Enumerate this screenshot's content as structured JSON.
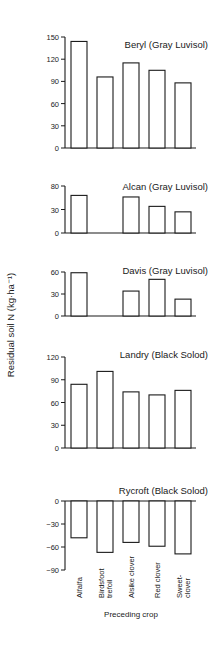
{
  "chart_data": {
    "type": "bar",
    "ylabel": "Residual soil N (kg·ha⁻¹)",
    "xlabel": "Preceding crop",
    "categories": [
      "Alfalfa",
      "Birdsfoot trefoil",
      "Alsike clover",
      "Red clover",
      "Sweet-clover"
    ],
    "category_label_lines": [
      [
        "Alfalfa"
      ],
      [
        "Birdsfoot",
        "trefoil"
      ],
      [
        "Alsike clover"
      ],
      [
        "Red clover"
      ],
      [
        "Sweet-",
        "clover"
      ]
    ],
    "panels": [
      {
        "title": "Beryl (Gray Luvisol)",
        "values": [
          144,
          96,
          115,
          105,
          88
        ],
        "ylim": [
          0,
          150
        ],
        "yticks": [
          0,
          30,
          60,
          90,
          120,
          150
        ],
        "ytick_labels": [
          "0",
          "30",
          "60",
          "90",
          "120",
          "150"
        ]
      },
      {
        "title": "Alcan (Gray Luvisol)",
        "values": [
          48,
          0,
          46,
          34,
          27
        ],
        "ylim": [
          0,
          60
        ],
        "yticks": [
          0,
          30,
          60
        ],
        "ytick_labels": [
          "0",
          "30",
          "80"
        ]
      },
      {
        "title": "Davis (Gray Luvisol)",
        "values": [
          59,
          0,
          34,
          50,
          23
        ],
        "ylim": [
          0,
          60
        ],
        "yticks": [
          0,
          30,
          60
        ],
        "ytick_labels": [
          "0",
          "30",
          "60"
        ]
      },
      {
        "title": "Landry (Black Solod)",
        "values": [
          84,
          101,
          74,
          70,
          76
        ],
        "ylim": [
          0,
          120
        ],
        "yticks": [
          0,
          30,
          60,
          90,
          120
        ],
        "ytick_labels": [
          "0",
          "30",
          "60",
          "90",
          "120"
        ]
      },
      {
        "title": "Rycroft (Black Solod)",
        "values": [
          -48,
          -67,
          -54,
          -59,
          -69
        ],
        "ylim": [
          -90,
          0
        ],
        "yticks": [
          0,
          -30,
          -60,
          -90
        ],
        "ytick_labels": [
          "0",
          "−30",
          "−60",
          "−90"
        ]
      }
    ],
    "grid": false,
    "legend": null
  }
}
